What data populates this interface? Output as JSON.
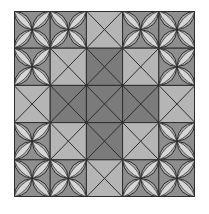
{
  "pattern": {
    "title": "Quilt tile pattern",
    "rows": 5,
    "cols": 5,
    "layout": [
      [
        "C",
        "C",
        "L",
        "C",
        "C"
      ],
      [
        "C",
        "L",
        "D",
        "L",
        "C"
      ],
      [
        "L",
        "D",
        "D",
        "D",
        "L"
      ],
      [
        "C",
        "L",
        "D",
        "L",
        "C"
      ],
      [
        "C",
        "C",
        "L",
        "C",
        "C"
      ]
    ],
    "legend": {
      "C": "circle-petal-tile",
      "L": "light-x-tile",
      "D": "dark-x-tile"
    },
    "colors": {
      "light_tile": "#b5b5b5",
      "dark_tile": "#7b7b7b",
      "circle_bg": "#8e8e8e",
      "petal_fill": "#d6d6d6",
      "petal_mid": "#a8a8a8",
      "line": "#2e2e2e",
      "background": "#ffffff"
    }
  }
}
